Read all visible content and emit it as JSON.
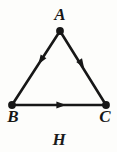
{
  "figure": {
    "name": "H",
    "caption_label": "H",
    "type": "directed-graph",
    "background_color": "#fdfdfb",
    "ink_color": "#171717",
    "width": 117,
    "height": 152
  },
  "graph": {
    "vertices": [
      {
        "id": "A",
        "label": "A",
        "x": 60,
        "y": 31,
        "label_x": 60,
        "label_y": 15
      },
      {
        "id": "B",
        "label": "B",
        "x": 12,
        "y": 105,
        "label_x": 13,
        "label_y": 117
      },
      {
        "id": "C",
        "label": "C",
        "x": 106,
        "y": 105,
        "label_x": 105,
        "label_y": 117
      }
    ],
    "edges": [
      {
        "id": "A-B",
        "from": "A",
        "to": "B",
        "directed": true,
        "arrow_position": 0.45
      },
      {
        "id": "A-C",
        "from": "A",
        "to": "C",
        "directed": true,
        "arrow_position": 0.48
      },
      {
        "id": "B-C",
        "from": "B",
        "to": "C",
        "directed": true,
        "arrow_position": 0.53
      }
    ],
    "vertex_dot_radius": 3.6,
    "edge_width": 2.6
  }
}
